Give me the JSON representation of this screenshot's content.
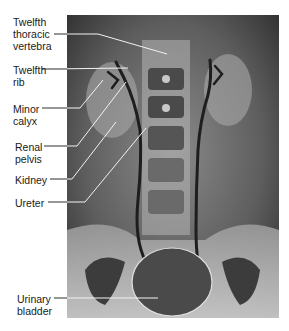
{
  "figure": {
    "type": "radiograph",
    "colors": {
      "background": "#ffffff",
      "leader_line": "#f2f2f2",
      "label_text": "#1a1a1a",
      "film_dark": "#3a3a3a",
      "film_light": "#c8c8c8"
    }
  },
  "labels": [
    {
      "id": "twelfth-thoracic-vertebra",
      "text": "Twelfth\nthoracic\nvertebra"
    },
    {
      "id": "twelfth-rib",
      "text": "Twelfth\nrib"
    },
    {
      "id": "minor-calyx",
      "text": "Minor\ncalyx"
    },
    {
      "id": "renal-pelvis",
      "text": "Renal\npelvis"
    },
    {
      "id": "kidney",
      "text": "Kidney"
    },
    {
      "id": "ureter",
      "text": "Ureter"
    },
    {
      "id": "urinary-bladder",
      "text": "Urinary\nbladder"
    }
  ]
}
